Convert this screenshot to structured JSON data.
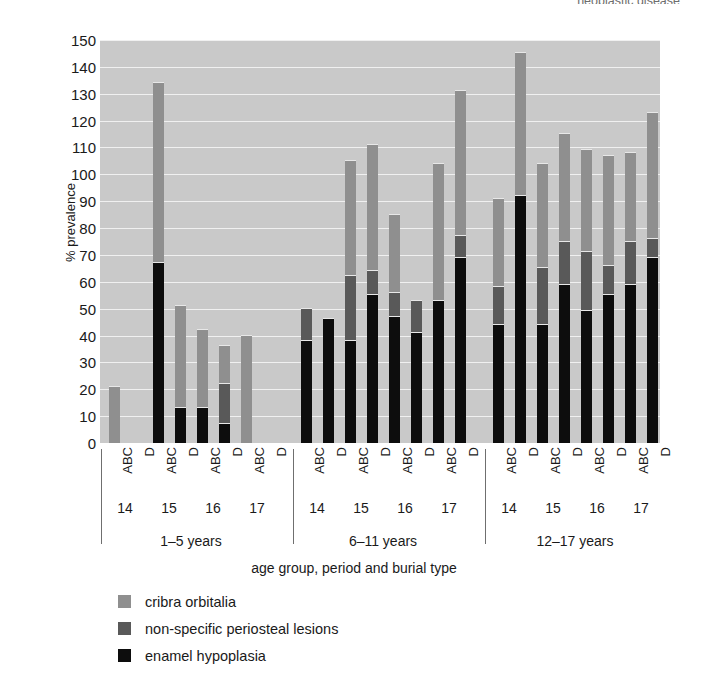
{
  "top_caption": "neoplastic disease",
  "axes": {
    "y_title": "% prevalence",
    "x_title": "age group, period and burial type",
    "y_ticks": [
      "150",
      "140",
      "130",
      "120",
      "110",
      "100",
      "90",
      "80",
      "70",
      "60",
      "50",
      "40",
      "30",
      "20",
      "10",
      "0"
    ]
  },
  "legend": [
    {
      "label": "cribra orbitalia",
      "color": "#8f8f8f",
      "key": "cribra"
    },
    {
      "label": "non-specific periosteal lesions",
      "color": "#595959",
      "key": "periosteal"
    },
    {
      "label": "enamel hypoplasia",
      "color": "#0d0d0d",
      "key": "hypoplasia"
    }
  ],
  "chart_data": {
    "type": "bar",
    "title": "",
    "subtitle": "",
    "stacked": true,
    "xlabel": "age group, period and burial type",
    "ylabel": "% prevalence",
    "ylim": [
      0,
      150
    ],
    "ytick_step": 10,
    "grid": true,
    "legend_position": "bottom-left",
    "series": [
      {
        "name": "enamel hypoplasia",
        "color": "#0d0d0d",
        "values": [
          0,
          0,
          67,
          13,
          13,
          7,
          0,
          0,
          38,
          46,
          38,
          55,
          47,
          41,
          53,
          69,
          44,
          92,
          44,
          59,
          49,
          55,
          59,
          69
        ]
      },
      {
        "name": "non-specific periosteal lesions",
        "color": "#595959",
        "values": [
          0,
          0,
          0,
          0,
          0,
          15,
          0,
          0,
          12,
          0,
          24,
          9,
          9,
          12,
          0,
          8,
          14,
          0,
          21,
          16,
          22,
          11,
          16,
          7
        ]
      },
      {
        "name": "cribra orbitalia",
        "color": "#8f8f8f",
        "values": [
          21,
          0,
          67,
          38,
          29,
          14,
          40,
          0,
          0,
          0,
          43,
          47,
          29,
          0,
          51,
          54,
          33,
          53,
          39,
          40,
          38,
          41,
          33,
          47
        ]
      }
    ],
    "totals": [
      21,
      0,
      134,
      51,
      42,
      36,
      40,
      0,
      50,
      46,
      105,
      111,
      85,
      53,
      104,
      131,
      91,
      145,
      104,
      115,
      109,
      107,
      108,
      123
    ],
    "categories": [
      "1-5 years / 14 / ABC",
      "1-5 years / 14 / D",
      "1-5 years / 15 / ABC",
      "1-5 years / 15 / D",
      "1-5 years / 16 / ABC",
      "1-5 years / 16 / D",
      "1-5 years / 17 / ABC",
      "1-5 years / 17 / D",
      "6-11 years / 14 / ABC",
      "6-11 years / 14 / D",
      "6-11 years / 15 / ABC",
      "6-11 years / 15 / D",
      "6-11 years / 16 / ABC",
      "6-11 years / 16 / D",
      "6-11 years / 17 / ABC",
      "6-11 years / 17 / D",
      "12-17 years / 14 / ABC",
      "12-17 years / 14 / D",
      "12-17 years / 15 / ABC",
      "12-17 years / 15 / D",
      "12-17 years / 16 / ABC",
      "12-17 years / 16 / D",
      "12-17 years / 17 / ABC",
      "12-17 years / 17 / D"
    ],
    "burial_types": [
      "ABC",
      "D",
      "ABC",
      "D",
      "ABC",
      "D",
      "ABC",
      "D",
      "ABC",
      "D",
      "ABC",
      "D",
      "ABC",
      "D",
      "ABC",
      "D",
      "ABC",
      "D",
      "ABC",
      "D",
      "ABC",
      "D",
      "ABC",
      "D"
    ],
    "periods": [
      "14",
      "15",
      "16",
      "17"
    ],
    "age_groups": [
      "1–5 years",
      "6–11 years",
      "12–17 years"
    ]
  }
}
